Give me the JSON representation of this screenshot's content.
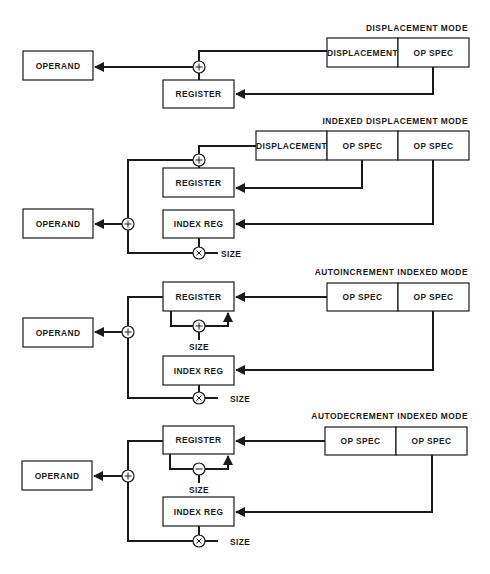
{
  "diagram": {
    "modes": [
      {
        "title": "DISPLACEMENT MODE",
        "instruction_fields": [
          "DISPLACEMENT",
          "OP SPEC"
        ],
        "blocks": {
          "operand": "OPERAND",
          "register": "REGISTER"
        },
        "operators": [
          "+"
        ]
      },
      {
        "title": "INDEXED DISPLACEMENT MODE",
        "instruction_fields": [
          "DISPLACEMENT",
          "OP SPEC",
          "OP SPEC"
        ],
        "blocks": {
          "operand": "OPERAND",
          "register": "REGISTER",
          "index_reg": "INDEX REG"
        },
        "operators": [
          "+",
          "+",
          "×"
        ],
        "size_label": "SIZE"
      },
      {
        "title": "AUTOINCREMENT INDEXED MODE",
        "instruction_fields": [
          "OP SPEC",
          "OP SPEC"
        ],
        "blocks": {
          "operand": "OPERAND",
          "register": "REGISTER",
          "index_reg": "INDEX REG"
        },
        "operators": [
          "+",
          "+",
          "×"
        ],
        "loop_size_label": "SIZE",
        "size_label": "SIZE"
      },
      {
        "title": "AUTODECREMENT INDEXED MODE",
        "instruction_fields": [
          "OP SPEC",
          "OP SPEC"
        ],
        "blocks": {
          "operand": "OPERAND",
          "register": "REGISTER",
          "index_reg": "INDEX REG"
        },
        "operators": [
          "+",
          "−",
          "×"
        ],
        "loop_size_label": "SIZE",
        "size_label": "SIZE"
      }
    ]
  },
  "colors": {
    "ink": "#1a1a1a",
    "background": "#ffffff"
  }
}
